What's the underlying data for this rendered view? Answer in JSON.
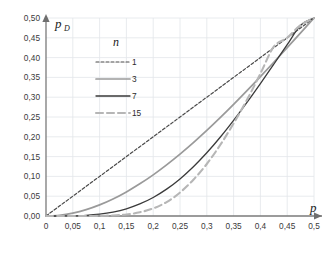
{
  "chart_data": {
    "type": "line",
    "title": "",
    "subtitle": "",
    "xlabel": "p",
    "ylabel": "p_D",
    "ylabel_base": "p",
    "ylabel_sub": "D",
    "xlim": [
      0,
      0.5
    ],
    "ylim": [
      0,
      0.5
    ],
    "grid": true,
    "legend_position": "upper-left-inside",
    "legend_title": "n",
    "xticks": [
      "0",
      "0,05",
      "0,1",
      "0,15",
      "0,2",
      "0,25",
      "0,3",
      "0,35",
      "0,4",
      "0,45",
      "0,5"
    ],
    "xtick_values": [
      0,
      0.05,
      0.1,
      0.15,
      0.2,
      0.25,
      0.3,
      0.35,
      0.4,
      0.45,
      0.5
    ],
    "yticks": [
      "0,00",
      "0,05",
      "0,10",
      "0,15",
      "0,20",
      "0,25",
      "0,30",
      "0,35",
      "0,40",
      "0,45",
      "0,50"
    ],
    "ytick_values": [
      0,
      0.05,
      0.1,
      0.15,
      0.2,
      0.25,
      0.3,
      0.35,
      0.4,
      0.45,
      0.5
    ],
    "x": [
      0,
      0.025,
      0.05,
      0.075,
      0.1,
      0.125,
      0.15,
      0.175,
      0.2,
      0.225,
      0.25,
      0.275,
      0.3,
      0.325,
      0.35,
      0.375,
      0.4,
      0.425,
      0.45,
      0.475,
      0.5
    ],
    "series": [
      {
        "name": "1",
        "label": "1",
        "color": "#4a4a4a",
        "dash": "3,2",
        "width": 1.2,
        "values": [
          0,
          0.025,
          0.05,
          0.075,
          0.1,
          0.125,
          0.15,
          0.175,
          0.2,
          0.225,
          0.25,
          0.275,
          0.3,
          0.325,
          0.35,
          0.375,
          0.4,
          0.425,
          0.45,
          0.475,
          0.5
        ]
      },
      {
        "name": "3",
        "label": "3",
        "color": "#9a9a9a",
        "dash": "none",
        "width": 1.7,
        "values": [
          0,
          0.00184,
          0.00725,
          0.01603,
          0.028,
          0.04297,
          0.0608,
          0.08127,
          0.104,
          0.12909,
          0.15625,
          0.18528,
          0.216,
          0.24822,
          0.28175,
          0.31641,
          0.352,
          0.38834,
          0.42525,
          0.46253,
          0.5
        ]
      },
      {
        "name": "7",
        "label": "7",
        "color": "#3a3a3a",
        "dash": "none",
        "width": 1.3,
        "values": [
          0,
          3e-05,
          0.00038,
          0.00164,
          0.00453,
          0.00981,
          0.01822,
          0.03045,
          0.0468,
          0.06785,
          0.09375,
          0.12445,
          0.15965,
          0.19888,
          0.24155,
          0.28699,
          0.33446,
          0.38321,
          0.43249,
          0.48158,
          0.5
        ]
      },
      {
        "name": "15",
        "label": "15",
        "color": "#b6b6b6",
        "dash": "7,4",
        "width": 2.1,
        "values": [
          0,
          1e-07,
          5e-06,
          6e-05,
          0.00035,
          0.00134,
          0.00391,
          0.00936,
          0.01923,
          0.03504,
          0.05923,
          0.09168,
          0.13134,
          0.17923,
          0.23389,
          0.2935,
          0.35959,
          0.4276,
          0.45,
          0.4821,
          0.5
        ]
      }
    ]
  },
  "legend": {
    "title": "n",
    "items": [
      {
        "label": "1"
      },
      {
        "label": "3"
      },
      {
        "label": "7"
      },
      {
        "label": "15"
      }
    ]
  },
  "axes": {
    "x_axis_label": "p",
    "y_axis_label_base": "p",
    "y_axis_label_sub": "D"
  }
}
